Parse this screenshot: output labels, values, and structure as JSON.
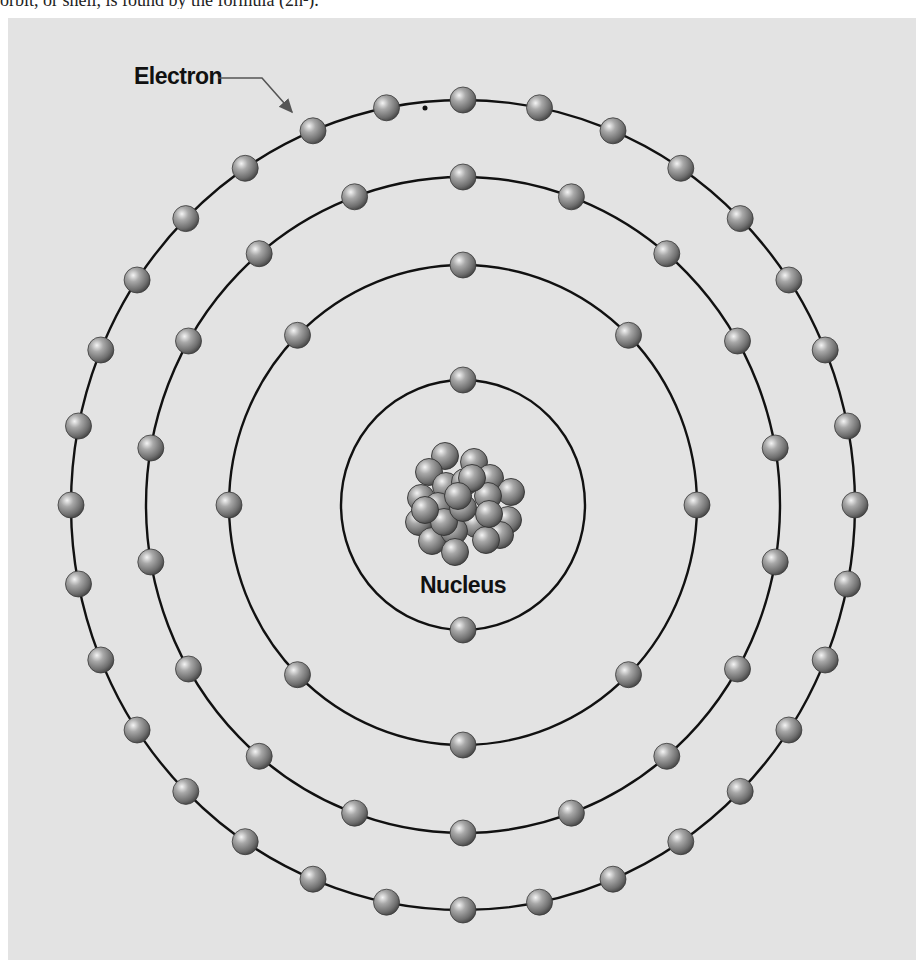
{
  "top_text": "orbit, or shell, is found by the formula (2n²).",
  "diagram": {
    "labels": {
      "electron": "Electron",
      "nucleus": "Nucleus"
    },
    "center": [
      463,
      505
    ],
    "orbits": [
      {
        "name": "shell-1",
        "rx": 122,
        "ry": 125,
        "electrons": 2
      },
      {
        "name": "shell-2",
        "rx": 234,
        "ry": 240,
        "electrons": 8
      },
      {
        "name": "shell-3",
        "rx": 317,
        "ry": 328,
        "electrons": 18
      },
      {
        "name": "shell-4",
        "rx": 392,
        "ry": 405,
        "electrons": 32
      }
    ],
    "electron_radius": 13,
    "nucleus_particles": 24,
    "colors": {
      "background": "#e3e3e3",
      "orbit_line": "#111111",
      "electron_light": "#f2f2f2",
      "electron_mid": "#9a9a9a",
      "electron_dark": "#5a5a5a",
      "pointer_line": "#555555"
    }
  }
}
